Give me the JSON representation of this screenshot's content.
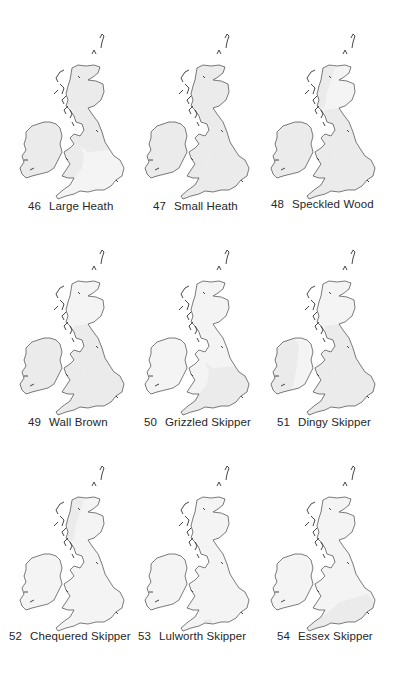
{
  "page": {
    "maps": [
      {
        "number": "46",
        "species": "Large Heath",
        "shaded": [
          "scotland",
          "ireland",
          "north_england",
          "wales"
        ]
      },
      {
        "number": "47",
        "species": "Small Heath",
        "shaded": [
          "scotland",
          "ireland",
          "north_england",
          "wales",
          "south_england"
        ]
      },
      {
        "number": "48",
        "species": "Speckled Wood",
        "shaded": [
          "scotland_west",
          "ireland",
          "wales",
          "south_england",
          "north_england"
        ]
      },
      {
        "number": "49",
        "species": "Wall Brown",
        "shaded": [
          "ireland",
          "wales",
          "south_england",
          "north_england"
        ]
      },
      {
        "number": "50",
        "species": "Grizzled Skipper",
        "shaded": [
          "south_england"
        ]
      },
      {
        "number": "51",
        "species": "Dingy Skipper",
        "shaded": [
          "ireland_west",
          "wales",
          "south_england",
          "north_england"
        ]
      },
      {
        "number": "52",
        "species": "Chequered Skipper",
        "shaded": [
          "scotland_west"
        ]
      },
      {
        "number": "53",
        "species": "Lulworth Skipper",
        "shaded": [
          "dorset"
        ]
      },
      {
        "number": "54",
        "species": "Essex Skipper",
        "shaded": [
          "southeast_england"
        ]
      }
    ]
  }
}
